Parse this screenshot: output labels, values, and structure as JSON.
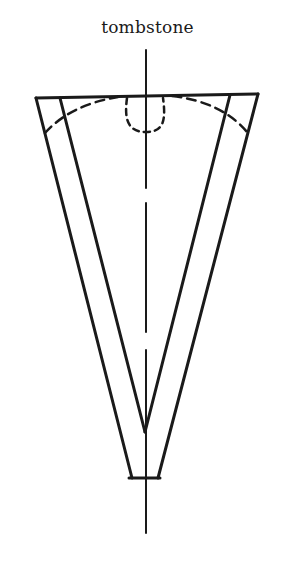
{
  "diagram": {
    "label": "tombstone",
    "stroke_color": "#1a1a1a",
    "background": "#ffffff",
    "shapes": {
      "center_axis": {
        "x": 146,
        "y_start": 50,
        "y_end": 533,
        "gaps": [
          [
            188,
            203
          ],
          [
            332,
            350
          ]
        ]
      },
      "top_edge": [
        [
          36,
          98
        ],
        [
          258,
          94
        ]
      ],
      "outer_left": [
        [
          36,
          98
        ],
        [
          132,
          478
        ]
      ],
      "outer_right": [
        [
          258,
          94
        ],
        [
          158,
          478
        ]
      ],
      "inner_left": [
        [
          60,
          98
        ],
        [
          145,
          432
        ]
      ],
      "inner_right": [
        [
          230,
          95
        ],
        [
          145,
          432
        ]
      ],
      "bottom_edge": [
        [
          130,
          478
        ],
        [
          160,
          478
        ]
      ],
      "dashed_arc_left": "M45,133 Q70,105 118,97",
      "dashed_arc_right": "M172,96 Q222,102 247,132",
      "dashed_u_notch": "M127,98 C124,120 128,132 146,132 C164,132 166,120 163,98"
    }
  }
}
